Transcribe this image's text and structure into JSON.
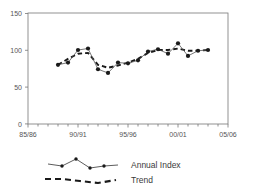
{
  "chart_data": {
    "type": "line",
    "title": "",
    "xlabel": "",
    "ylabel": "",
    "ylim": [
      0,
      150
    ],
    "yticks": [
      0,
      50,
      100,
      150
    ],
    "ytick_labels": [
      "0",
      "50",
      "100",
      "150"
    ],
    "xlim": [
      1985,
      2005
    ],
    "xticks": [
      1985,
      1990,
      1995,
      2000,
      2005
    ],
    "xtick_labels": [
      "85/86",
      "90/91",
      "95/96",
      "00/01",
      "05/06"
    ],
    "minor_xticks_every_years": 1,
    "grid": false,
    "legend_position": "bottom",
    "x": [
      1988,
      1989,
      1990,
      1991,
      1992,
      1993,
      1994,
      1995,
      1996,
      1997,
      1998,
      1999,
      2000,
      2001,
      2002,
      2003
    ],
    "x_labels": [
      "88/89",
      "89/90",
      "90/91",
      "91/92",
      "92/93",
      "93/94",
      "94/95",
      "95/96",
      "96/97",
      "97/98",
      "98/99",
      "99/00",
      "00/01",
      "01/02",
      "02/03",
      "03/04"
    ],
    "series": [
      {
        "name": "Annual Index",
        "style": "solid-with-markers",
        "color": "#1a1a1a",
        "values": [
          80,
          83,
          100,
          102,
          74,
          69,
          83,
          82,
          86,
          98,
          101,
          95,
          109,
          92,
          99,
          100
        ]
      },
      {
        "name": "Trend",
        "style": "dashed",
        "color": "#1a1a1a",
        "values": [
          80,
          88,
          95,
          96,
          80,
          76,
          79,
          83,
          88,
          96,
          100,
          100,
          102,
          99,
          99,
          100
        ]
      }
    ]
  },
  "axes": {
    "y_tick_labels": [
      "150",
      "100",
      "50",
      "0"
    ],
    "x_tick_labels": [
      "85/86",
      "90/91",
      "95/96",
      "00/01",
      "05/06"
    ]
  },
  "legend": {
    "items": [
      {
        "label": "Annual Index",
        "style": "solid-with-markers"
      },
      {
        "label": "Trend",
        "style": "dashed"
      }
    ]
  }
}
